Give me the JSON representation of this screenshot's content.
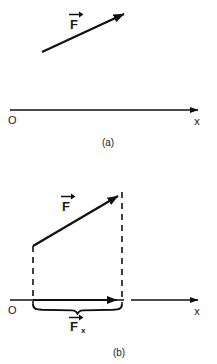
{
  "figure": {
    "title_hidden": "",
    "background_color": "#ffffff",
    "stroke_color": "#111111",
    "panels": [
      {
        "id": "a",
        "caption": "(a)",
        "origin_label": "O",
        "axis_label": "x",
        "vector_label": "F",
        "vector_label_accent": "→",
        "axis": {
          "x1": 10,
          "y1": 110,
          "x2": 202,
          "y2": 110
        },
        "force_vector": {
          "x1": 42,
          "y1": 52,
          "x2": 129,
          "y2": 11
        },
        "force_label_pos": {
          "x": 74,
          "y": 24
        },
        "origin_label_pos": {
          "x": 8,
          "y": 124
        },
        "axis_label_pos": {
          "x": 197,
          "y": 125
        },
        "caption_pos": {
          "x": 108,
          "y": 146
        }
      },
      {
        "id": "b",
        "caption": "(b)",
        "origin_label": "O",
        "axis_label": "x",
        "vector_label": "F",
        "vector_label_accent": "→",
        "component_label": "F",
        "component_subscript": "x",
        "component_label_accent": "→",
        "axis": {
          "x1": 10,
          "y1": 300,
          "x2": 202,
          "y2": 300
        },
        "axis_break": {
          "gap_start": 124,
          "gap_end": 131
        },
        "force_vector": {
          "x1": 33,
          "y1": 246,
          "x2": 123,
          "y2": 193
        },
        "component_vector": {
          "x1": 33,
          "y1": 300,
          "x2": 122,
          "y2": 300
        },
        "dashed_line_left": {
          "x": 33,
          "y1": 246,
          "y2": 302
        },
        "dashed_line_right": {
          "x": 122,
          "y1": 193,
          "y2": 302
        },
        "brace": {
          "x1": 33,
          "x2": 122,
          "y": 307
        },
        "force_label_pos": {
          "x": 66,
          "y": 206
        },
        "component_label_pos": {
          "x": 74,
          "y": 330
        },
        "origin_label_pos": {
          "x": 8,
          "y": 314
        },
        "axis_label_pos": {
          "x": 197,
          "y": 315
        },
        "caption_pos": {
          "x": 119,
          "y": 356
        }
      }
    ]
  }
}
